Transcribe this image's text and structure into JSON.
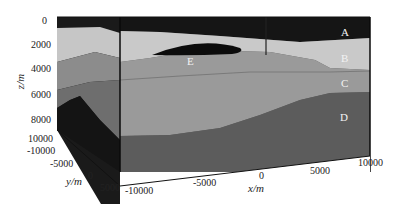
{
  "figure": {
    "type": "3d-geological-block-model",
    "colors": {
      "A": "#151515",
      "B": "#c9c9c9",
      "C": "#9a9a9a",
      "D": "#5c5c5c",
      "E": "#0c0c0c",
      "side_dark": "#1a1a1a",
      "side_mid": "#737373",
      "side_light": "#bdbdbd"
    },
    "layers": [
      {
        "id": "A",
        "label": "A"
      },
      {
        "id": "B",
        "label": "B"
      },
      {
        "id": "C",
        "label": "C"
      },
      {
        "id": "D",
        "label": "D"
      },
      {
        "id": "E",
        "label": "E"
      }
    ]
  },
  "axes": {
    "z": {
      "label": "z/m",
      "ticks": [
        "0",
        "2000",
        "4000",
        "6000",
        "8000",
        "10000"
      ]
    },
    "y": {
      "label": "y/m",
      "ticks": [
        "-10000",
        "-5000",
        "0",
        "5000"
      ]
    },
    "x": {
      "label": "x/m",
      "ticks": [
        "-10000",
        "-5000",
        "0",
        "5000",
        "10000"
      ]
    }
  }
}
